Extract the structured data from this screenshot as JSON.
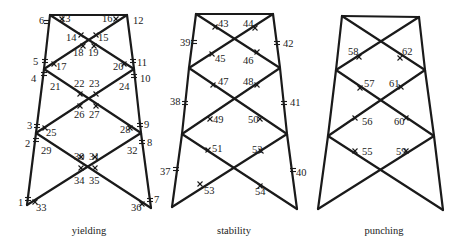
{
  "figure": {
    "panels": [
      {
        "id": "yielding",
        "caption": "yielding",
        "caption_pos": [
          89,
          234
        ],
        "nodes": {
          "TL": [
            50,
            15
          ],
          "TR": [
            127,
            15
          ],
          "ML": [
            44,
            69
          ],
          "MR": [
            134,
            69
          ],
          "LL": [
            36,
            133
          ],
          "LR": [
            141,
            133
          ],
          "BL": [
            27,
            205
          ],
          "BR": [
            151,
            208
          ]
        },
        "hinges": [
          {
            "at": [
              47,
              22
            ],
            "dir": "v"
          },
          {
            "at": [
              62,
              19
            ],
            "dir": "d"
          },
          {
            "at": [
              116,
              19
            ],
            "dir": "d"
          },
          {
            "at": [
              81,
              35
            ],
            "dir": "d"
          },
          {
            "at": [
              96,
              35
            ],
            "dir": "d"
          },
          {
            "at": [
              83,
              46
            ],
            "dir": "d"
          },
          {
            "at": [
              94,
              46
            ],
            "dir": "d"
          },
          {
            "at": [
              45,
              61
            ],
            "dir": "v"
          },
          {
            "at": [
              44,
              74
            ],
            "dir": "v"
          },
          {
            "at": [
              54,
              64
            ],
            "dir": "d"
          },
          {
            "at": [
              124,
              64
            ],
            "dir": "d"
          },
          {
            "at": [
              133,
              61
            ],
            "dir": "v"
          },
          {
            "at": [
              134,
              76
            ],
            "dir": "v"
          },
          {
            "at": [
              80,
              94
            ],
            "dir": "d"
          },
          {
            "at": [
              96,
              94
            ],
            "dir": "d"
          },
          {
            "at": [
              80,
              106
            ],
            "dir": "d"
          },
          {
            "at": [
              96,
              106
            ],
            "dir": "d"
          },
          {
            "at": [
              37,
              126
            ],
            "dir": "v"
          },
          {
            "at": [
              36,
              140
            ],
            "dir": "v"
          },
          {
            "at": [
              45,
              128
            ],
            "dir": "d"
          },
          {
            "at": [
              130,
              128
            ],
            "dir": "d"
          },
          {
            "at": [
              140,
              125
            ],
            "dir": "v"
          },
          {
            "at": [
              142,
              142
            ],
            "dir": "v"
          },
          {
            "at": [
              81,
              157
            ],
            "dir": "d"
          },
          {
            "at": [
              95,
              157
            ],
            "dir": "d"
          },
          {
            "at": [
              81,
              168
            ],
            "dir": "d"
          },
          {
            "at": [
              95,
              168
            ],
            "dir": "d"
          },
          {
            "at": [
              28,
              199
            ],
            "dir": "v"
          },
          {
            "at": [
              35,
              202
            ],
            "dir": "d"
          },
          {
            "at": [
              142,
              204
            ],
            "dir": "d"
          },
          {
            "at": [
              150,
              200
            ],
            "dir": "v"
          }
        ],
        "labels": [
          {
            "text": "1",
            "x": 18,
            "y": 206
          },
          {
            "text": "2",
            "x": 25,
            "y": 147
          },
          {
            "text": "3",
            "x": 27,
            "y": 129
          },
          {
            "text": "4",
            "x": 31,
            "y": 82
          },
          {
            "text": "5",
            "x": 33,
            "y": 65
          },
          {
            "text": "6",
            "x": 39,
            "y": 24
          },
          {
            "text": "7",
            "x": 154,
            "y": 203
          },
          {
            "text": "8",
            "x": 147,
            "y": 146
          },
          {
            "text": "9",
            "x": 144,
            "y": 128
          },
          {
            "text": "10",
            "x": 140,
            "y": 82
          },
          {
            "text": "11",
            "x": 137,
            "y": 66
          },
          {
            "text": "12",
            "x": 133,
            "y": 24
          },
          {
            "text": "13",
            "x": 60,
            "y": 22
          },
          {
            "text": "14",
            "x": 66,
            "y": 41
          },
          {
            "text": "15",
            "x": 98,
            "y": 41
          },
          {
            "text": "16",
            "x": 102,
            "y": 22
          },
          {
            "text": "17",
            "x": 56,
            "y": 70
          },
          {
            "text": "18",
            "x": 73,
            "y": 56
          },
          {
            "text": "19",
            "x": 88,
            "y": 56
          },
          {
            "text": "20",
            "x": 113,
            "y": 70
          },
          {
            "text": "21",
            "x": 50,
            "y": 90
          },
          {
            "text": "22",
            "x": 74,
            "y": 87
          },
          {
            "text": "23",
            "x": 89,
            "y": 87
          },
          {
            "text": "24",
            "x": 119,
            "y": 90
          },
          {
            "text": "25",
            "x": 46,
            "y": 136
          },
          {
            "text": "26",
            "x": 74,
            "y": 118
          },
          {
            "text": "27",
            "x": 89,
            "y": 118
          },
          {
            "text": "28",
            "x": 120,
            "y": 133
          },
          {
            "text": "29",
            "x": 41,
            "y": 154
          },
          {
            "text": "30",
            "x": 74,
            "y": 160
          },
          {
            "text": "31",
            "x": 89,
            "y": 160
          },
          {
            "text": "32",
            "x": 127,
            "y": 154
          },
          {
            "text": "33",
            "x": 36,
            "y": 211
          },
          {
            "text": "34",
            "x": 74,
            "y": 184
          },
          {
            "text": "35",
            "x": 89,
            "y": 184
          },
          {
            "text": "36",
            "x": 131,
            "y": 211
          }
        ]
      },
      {
        "id": "stability",
        "caption": "stability",
        "caption_pos": [
          234,
          234
        ],
        "nodes": {
          "TL": [
            196,
            14
          ],
          "TR": [
            273,
            14
          ],
          "ML": [
            189,
            68
          ],
          "MR": [
            280,
            68
          ],
          "LL": [
            182,
            134
          ],
          "LR": [
            287,
            134
          ],
          "BL": [
            172,
            207
          ],
          "BR": [
            297,
            209
          ]
        },
        "hinges": [
          {
            "at": [
              194,
              42
            ],
            "dir": "v"
          },
          {
            "at": [
              277,
              43
            ],
            "dir": "v"
          },
          {
            "at": [
              215,
              27
            ],
            "dir": "d"
          },
          {
            "at": [
              255,
              28
            ],
            "dir": "d"
          },
          {
            "at": [
              212,
              54
            ],
            "dir": "d"
          },
          {
            "at": [
              257,
              52
            ],
            "dir": "d"
          },
          {
            "at": [
              213,
              85
            ],
            "dir": "d"
          },
          {
            "at": [
              257,
              85
            ],
            "dir": "d"
          },
          {
            "at": [
              185,
              103
            ],
            "dir": "v"
          },
          {
            "at": [
              284,
              103
            ],
            "dir": "v"
          },
          {
            "at": [
              210,
              119
            ],
            "dir": "d"
          },
          {
            "at": [
              260,
              119
            ],
            "dir": "d"
          },
          {
            "at": [
              208,
              150
            ],
            "dir": "d"
          },
          {
            "at": [
              261,
              151
            ],
            "dir": "d"
          },
          {
            "at": [
              176,
              169
            ],
            "dir": "v"
          },
          {
            "at": [
              293,
              170
            ],
            "dir": "v"
          },
          {
            "at": [
              200,
              184
            ],
            "dir": "d"
          },
          {
            "at": [
              260,
              186
            ],
            "dir": "d"
          }
        ],
        "labels": [
          {
            "text": "37",
            "x": 160,
            "y": 175
          },
          {
            "text": "38",
            "x": 170,
            "y": 105
          },
          {
            "text": "39",
            "x": 180,
            "y": 46
          },
          {
            "text": "40",
            "x": 296,
            "y": 176
          },
          {
            "text": "41",
            "x": 290,
            "y": 106
          },
          {
            "text": "42",
            "x": 283,
            "y": 47
          },
          {
            "text": "43",
            "x": 218,
            "y": 27
          },
          {
            "text": "44",
            "x": 243,
            "y": 27
          },
          {
            "text": "45",
            "x": 215,
            "y": 62
          },
          {
            "text": "46",
            "x": 243,
            "y": 64
          },
          {
            "text": "47",
            "x": 218,
            "y": 85
          },
          {
            "text": "48",
            "x": 243,
            "y": 85
          },
          {
            "text": "49",
            "x": 213,
            "y": 123
          },
          {
            "text": "50",
            "x": 248,
            "y": 123
          },
          {
            "text": "51",
            "x": 212,
            "y": 152
          },
          {
            "text": "52",
            "x": 252,
            "y": 153
          },
          {
            "text": "53",
            "x": 204,
            "y": 194
          },
          {
            "text": "54",
            "x": 255,
            "y": 195
          }
        ]
      },
      {
        "id": "punching",
        "caption": "punching",
        "caption_pos": [
          384,
          234
        ],
        "nodes": {
          "TL": [
            342,
            16
          ],
          "TR": [
            419,
            17
          ],
          "ML": [
            336,
            70
          ],
          "MR": [
            425,
            70
          ],
          "LL": [
            328,
            136
          ],
          "LR": [
            434,
            136
          ],
          "BL": [
            318,
            209
          ],
          "BR": [
            443,
            210
          ]
        },
        "hinges": [
          {
            "at": [
              359,
              57
            ],
            "dir": "d"
          },
          {
            "at": [
              400,
              58
            ],
            "dir": "d"
          },
          {
            "at": [
              360,
              88
            ],
            "dir": "d"
          },
          {
            "at": [
              401,
              87
            ],
            "dir": "d"
          },
          {
            "at": [
              355,
              118
            ],
            "dir": "d"
          },
          {
            "at": [
              406,
              118
            ],
            "dir": "d"
          },
          {
            "at": [
              355,
              151
            ],
            "dir": "d"
          },
          {
            "at": [
              406,
              151
            ],
            "dir": "d"
          }
        ],
        "labels": [
          {
            "text": "55",
            "x": 362,
            "y": 155
          },
          {
            "text": "56",
            "x": 362,
            "y": 125
          },
          {
            "text": "57",
            "x": 364,
            "y": 87
          },
          {
            "text": "58",
            "x": 348,
            "y": 55
          },
          {
            "text": "59",
            "x": 396,
            "y": 155
          },
          {
            "text": "60",
            "x": 394,
            "y": 125
          },
          {
            "text": "61",
            "x": 389,
            "y": 87
          },
          {
            "text": "62",
            "x": 402,
            "y": 55
          }
        ]
      }
    ]
  }
}
